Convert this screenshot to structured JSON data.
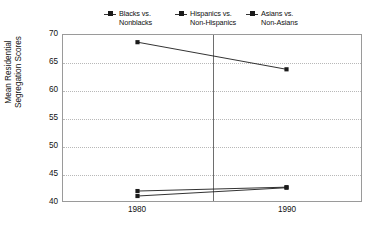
{
  "chart_data": {
    "type": "line",
    "title": "",
    "xlabel": "",
    "ylabel": "Mean Residential\nSegregation Scores",
    "categories": [
      "1980",
      "1990"
    ],
    "x": [
      1980,
      1990
    ],
    "ylim": [
      40,
      70
    ],
    "yticks": [
      40,
      45,
      50,
      55,
      60,
      65,
      70
    ],
    "grid": true,
    "legend_position": "top",
    "series": [
      {
        "name": "Blacks vs.\nNonblacks",
        "values": [
          68.7,
          63.8
        ]
      },
      {
        "name": "Hispanics vs.\nNon-Hispanics",
        "values": [
          41.8,
          42.5
        ]
      },
      {
        "name": "Asians vs.\nNon-Asians",
        "values": [
          40.9,
          42.4
        ]
      }
    ]
  },
  "legend": {
    "items": [
      {
        "label": "Blacks vs.\nNonblacks"
      },
      {
        "label": "Hispanics vs.\nNon-Hispanics"
      },
      {
        "label": "Asians vs.\nNon-Asians"
      }
    ]
  },
  "axes": {
    "y_label": "Mean Residential\nSegregation Scores",
    "y_ticks": [
      "70",
      "65",
      "60",
      "55",
      "50",
      "45",
      "40"
    ],
    "x_ticks": [
      "1980",
      "1990"
    ]
  },
  "colors": {
    "series": "#1a1a1a",
    "grid": "#b8b8b8",
    "frame": "#9a9a9a",
    "divider": "#6e6e6e",
    "text": "#111111",
    "background": "#ffffff"
  }
}
